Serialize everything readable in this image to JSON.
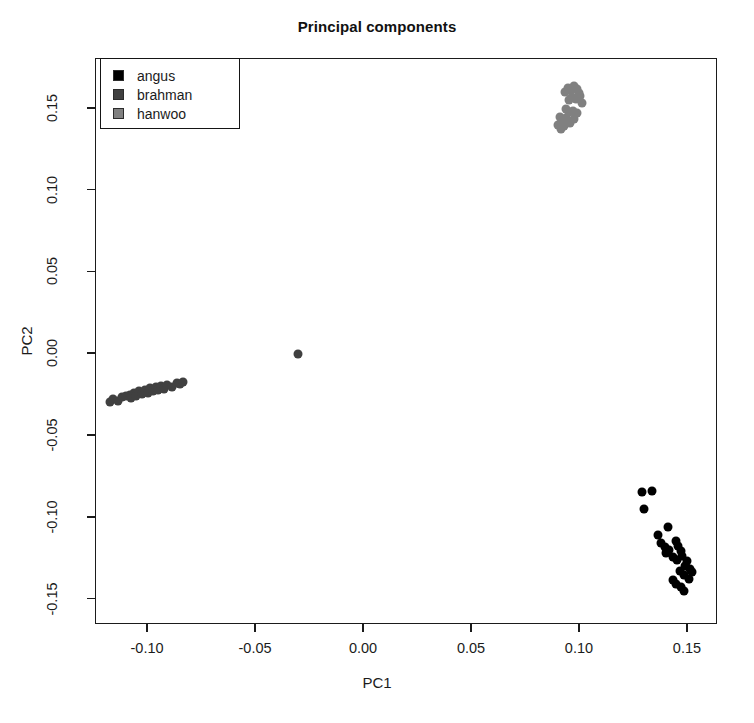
{
  "chart_data": {
    "type": "scatter",
    "title": "Principal components",
    "xlabel": "PC1",
    "ylabel": "PC2",
    "xlim": [
      -0.1241,
      0.1639
    ],
    "ylim": [
      -0.1655,
      0.1805
    ],
    "xticks": [
      "-0.10",
      "-0.05",
      "0.00",
      "0.05",
      "0.10",
      "0.15"
    ],
    "xtick_values": [
      -0.1,
      -0.05,
      0.0,
      0.05,
      0.1,
      0.15
    ],
    "yticks": [
      "0.15",
      "0.10",
      "0.05",
      "0.00",
      "-0.05",
      "-0.10",
      "-0.15"
    ],
    "ytick_values": [
      0.15,
      0.1,
      0.05,
      0.0,
      -0.05,
      -0.1,
      -0.15
    ],
    "grid": false,
    "legend_position": "top-left",
    "marker_size_px": 9,
    "series": [
      {
        "name": "angus",
        "color": "#000000",
        "points": [
          [
            0.1292,
            -0.0851
          ],
          [
            0.1338,
            -0.0839
          ],
          [
            0.1301,
            -0.0954
          ],
          [
            0.1366,
            -0.1109
          ],
          [
            0.1412,
            -0.1063
          ],
          [
            0.138,
            -0.1161
          ],
          [
            0.1398,
            -0.1184
          ],
          [
            0.1417,
            -0.1201
          ],
          [
            0.1403,
            -0.1224
          ],
          [
            0.1449,
            -0.1149
          ],
          [
            0.1458,
            -0.1178
          ],
          [
            0.1472,
            -0.1207
          ],
          [
            0.1435,
            -0.1247
          ],
          [
            0.1454,
            -0.1264
          ],
          [
            0.1477,
            -0.1241
          ],
          [
            0.15,
            -0.127
          ],
          [
            0.1491,
            -0.1299
          ],
          [
            0.1514,
            -0.1316
          ],
          [
            0.1468,
            -0.1328
          ],
          [
            0.1486,
            -0.1356
          ],
          [
            0.1509,
            -0.1379
          ],
          [
            0.1523,
            -0.1339
          ],
          [
            0.1435,
            -0.1385
          ],
          [
            0.1449,
            -0.1408
          ],
          [
            0.1472,
            -0.1431
          ],
          [
            0.1486,
            -0.1454
          ]
        ]
      },
      {
        "name": "brahman",
        "color": "#404040",
        "points": [
          [
            -0.1171,
            -0.0299
          ],
          [
            -0.1157,
            -0.0282
          ],
          [
            -0.1134,
            -0.0293
          ],
          [
            -0.1116,
            -0.027
          ],
          [
            -0.1097,
            -0.0264
          ],
          [
            -0.1079,
            -0.0253
          ],
          [
            -0.1074,
            -0.0276
          ],
          [
            -0.106,
            -0.0241
          ],
          [
            -0.1051,
            -0.0264
          ],
          [
            -0.1037,
            -0.023
          ],
          [
            -0.1023,
            -0.0247
          ],
          [
            -0.1009,
            -0.0224
          ],
          [
            -0.0995,
            -0.0241
          ],
          [
            -0.0986,
            -0.0213
          ],
          [
            -0.0972,
            -0.023
          ],
          [
            -0.0958,
            -0.0207
          ],
          [
            -0.0949,
            -0.0224
          ],
          [
            -0.0935,
            -0.0201
          ],
          [
            -0.0921,
            -0.0218
          ],
          [
            -0.0907,
            -0.0195
          ],
          [
            -0.0884,
            -0.0207
          ],
          [
            -0.0861,
            -0.0184
          ],
          [
            -0.0847,
            -0.019
          ],
          [
            -0.0833,
            -0.0178
          ],
          [
            -0.0301,
            -0.0006
          ]
        ]
      },
      {
        "name": "hanwoo",
        "color": "#808080",
        "points": [
          [
            0.0935,
            0.1598
          ],
          [
            0.0949,
            0.1621
          ],
          [
            0.0963,
            0.1609
          ],
          [
            0.0977,
            0.1632
          ],
          [
            0.0991,
            0.1615
          ],
          [
            0.1,
            0.1592
          ],
          [
            0.0954,
            0.1546
          ],
          [
            0.0968,
            0.1569
          ],
          [
            0.0986,
            0.1552
          ],
          [
            0.1005,
            0.1575
          ],
          [
            0.1014,
            0.1529
          ],
          [
            0.094,
            0.1495
          ],
          [
            0.0954,
            0.1472
          ],
          [
            0.0972,
            0.1483
          ],
          [
            0.0991,
            0.1466
          ],
          [
            0.0912,
            0.1443
          ],
          [
            0.0926,
            0.142
          ],
          [
            0.094,
            0.1437
          ],
          [
            0.0958,
            0.1409
          ],
          [
            0.0903,
            0.1397
          ],
          [
            0.0917,
            0.1374
          ],
          [
            0.0931,
            0.1391
          ],
          [
            0.0977,
            0.1432
          ]
        ]
      }
    ]
  },
  "legend": {
    "entries": [
      {
        "label": "angus",
        "color": "#000000"
      },
      {
        "label": "brahman",
        "color": "#404040"
      },
      {
        "label": "hanwoo",
        "color": "#808080"
      }
    ]
  }
}
